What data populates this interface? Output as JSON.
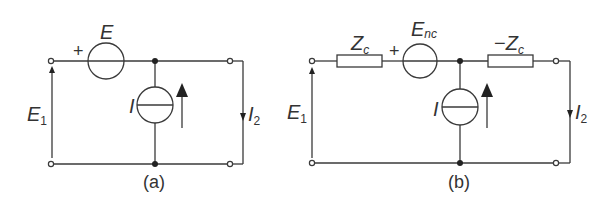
{
  "circuits": {
    "a": {
      "caption": "(a)",
      "voltage_source": {
        "label": "E",
        "polarity": "+"
      },
      "current_source": {
        "label": "I"
      },
      "input_voltage": {
        "base": "E",
        "sub": "1"
      },
      "output_current": {
        "base": "I",
        "sub": "2"
      }
    },
    "b": {
      "caption": "(b)",
      "series_impedance_left": {
        "base": "Z",
        "sub": "c"
      },
      "voltage_source": {
        "base": "E",
        "sub": "nc",
        "polarity": "+"
      },
      "series_impedance_right": {
        "prefix": "−",
        "base": "Z",
        "sub": "c"
      },
      "current_source": {
        "label": "I"
      },
      "input_voltage": {
        "base": "E",
        "sub": "1"
      },
      "output_current": {
        "base": "I",
        "sub": "2"
      }
    }
  },
  "colors": {
    "line": "#3a3a3a",
    "text": "#333333",
    "background": "#ffffff"
  }
}
